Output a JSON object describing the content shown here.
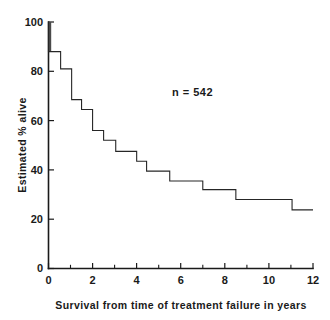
{
  "chart_data": {
    "type": "line",
    "subtype": "kaplan-meier-step",
    "title": "",
    "xlabel": "Survival from time of treatment failure in years",
    "ylabel": "Estimated % alive",
    "xlim": [
      0,
      12
    ],
    "ylim": [
      0,
      100
    ],
    "grid": false,
    "legend": null,
    "annotations": [
      {
        "text": "n = 542",
        "x": 5.6,
        "y": 70
      }
    ],
    "xticks": [
      0,
      2,
      4,
      6,
      8,
      10,
      12
    ],
    "xticklabels": [
      "0",
      "2",
      "4",
      "6",
      "8",
      "10",
      "12"
    ],
    "xminorticks": [
      1,
      3,
      5,
      7,
      9,
      11
    ],
    "yticks": [
      0,
      20,
      40,
      60,
      80,
      100
    ],
    "yticklabels": [
      "0",
      "20",
      "40",
      "60",
      "80",
      "100"
    ],
    "series": [
      {
        "name": "Estimated % alive",
        "x": [
          0.0,
          0.0,
          0.55,
          0.55,
          1.05,
          1.05,
          1.5,
          1.5,
          2.0,
          2.0,
          2.5,
          2.5,
          3.05,
          3.05,
          4.0,
          4.0,
          4.45,
          4.45,
          5.5,
          5.5,
          7.0,
          7.0,
          8.5,
          8.5,
          11.05,
          11.05,
          12.0
        ],
        "y": [
          100.0,
          88.0,
          88.0,
          81.0,
          81.0,
          68.5,
          68.5,
          64.5,
          64.5,
          56.0,
          56.0,
          52.0,
          52.0,
          47.5,
          47.5,
          43.5,
          43.5,
          39.5,
          39.5,
          35.5,
          35.5,
          32.0,
          32.0,
          28.0,
          28.0,
          23.8,
          23.8
        ],
        "points": [
          {
            "time": 0.0,
            "percent_alive": 100.0
          },
          {
            "time": 0.0,
            "percent_alive": 88.0
          },
          {
            "time": 0.55,
            "percent_alive": 81.0
          },
          {
            "time": 1.05,
            "percent_alive": 68.5
          },
          {
            "time": 1.5,
            "percent_alive": 64.5
          },
          {
            "time": 2.0,
            "percent_alive": 56.0
          },
          {
            "time": 2.5,
            "percent_alive": 52.0
          },
          {
            "time": 3.05,
            "percent_alive": 47.5
          },
          {
            "time": 4.0,
            "percent_alive": 43.5
          },
          {
            "time": 4.45,
            "percent_alive": 39.5
          },
          {
            "time": 5.5,
            "percent_alive": 35.5
          },
          {
            "time": 7.0,
            "percent_alive": 32.0
          },
          {
            "time": 8.5,
            "percent_alive": 28.0
          },
          {
            "time": 11.05,
            "percent_alive": 23.8
          },
          {
            "time": 12.0,
            "percent_alive": 23.8
          }
        ]
      }
    ],
    "colors": {
      "curve": "#262626",
      "axis": "#1a1a1a",
      "text": "#1a1a1a",
      "background": "#ffffff"
    }
  }
}
